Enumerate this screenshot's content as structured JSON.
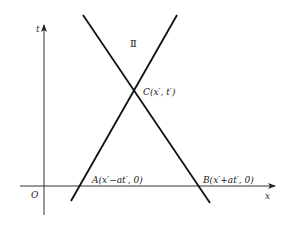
{
  "diagram": {
    "type": "characteristic-lines",
    "axes": {
      "x_label": "x",
      "t_label": "t",
      "origin_label": "O"
    },
    "region_label": "Ⅱ",
    "points": {
      "C": "C(x′, t′)",
      "A": "A(x′−at′, 0)",
      "B": "B(x′+at′, 0)"
    },
    "lines": [
      {
        "name": "characteristic-through-A",
        "from": [
          71,
          201
        ],
        "to": [
          177,
          15
        ]
      },
      {
        "name": "characteristic-through-B",
        "from": [
          83,
          15
        ],
        "to": [
          210,
          203
        ]
      }
    ],
    "colors": {
      "line": "#111111",
      "axis": "#333333",
      "text": "#222222"
    }
  }
}
